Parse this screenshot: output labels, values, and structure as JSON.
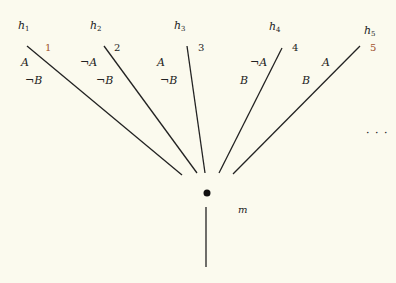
{
  "diagram": {
    "branches": [
      {
        "hypothesis": "h",
        "index": "1",
        "number": "1",
        "lit_a": "A",
        "lit_b": "¬B"
      },
      {
        "hypothesis": "h",
        "index": "2",
        "number": "2",
        "lit_a": "¬A",
        "lit_b": "¬B"
      },
      {
        "hypothesis": "h",
        "index": "3",
        "number": "3",
        "lit_a": "A",
        "lit_b": "¬B"
      },
      {
        "hypothesis": "h",
        "index": "4",
        "number": "4",
        "lit_a": "¬A",
        "lit_b": "B"
      },
      {
        "hypothesis": "h",
        "index": "5",
        "number": "5",
        "lit_a": "A",
        "lit_b": "B"
      }
    ],
    "node_label": "m",
    "ellipsis": "· · ·"
  }
}
